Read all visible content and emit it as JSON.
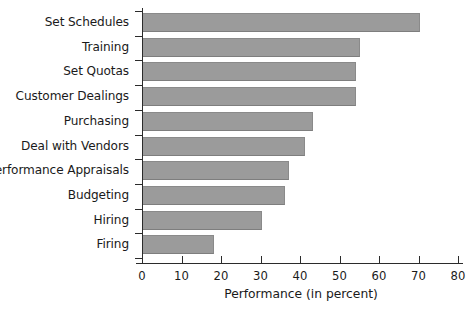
{
  "chart_data": {
    "type": "bar",
    "orientation": "horizontal",
    "title": "",
    "xlabel": "Performance (in percent)",
    "ylabel": "",
    "xlim": [
      0,
      80
    ],
    "xticks": [
      0,
      10,
      20,
      30,
      40,
      50,
      60,
      70,
      80
    ],
    "grid": false,
    "legend": null,
    "bar_color": "#9b9b9b",
    "categories": [
      "Set Schedules",
      "Training",
      "Set Quotas",
      "Customer Dealings",
      "Purchasing",
      "Deal with Vendors",
      "Performance Appraisals",
      "Budgeting",
      "Hiring",
      "Firing"
    ],
    "values": [
      70,
      55,
      54,
      54,
      43,
      41,
      37,
      36,
      30,
      18
    ]
  }
}
